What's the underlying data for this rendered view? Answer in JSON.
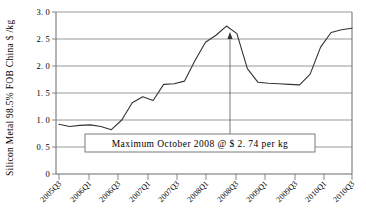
{
  "chart_data": {
    "type": "line",
    "title": "",
    "xlabel": "",
    "ylabel": "Silicon Metal 98.5% FOB China  $ /kg",
    "ylim": [
      0,
      3.0
    ],
    "yticks": [
      "0",
      "0. 5",
      "1. 0",
      "1. 5",
      "2. 0",
      "2. 5",
      "3. 0"
    ],
    "ytick_values": [
      0,
      0.5,
      1.0,
      1.5,
      2.0,
      2.5,
      3.0
    ],
    "grid": true,
    "legend": "none",
    "categories": [
      "2005Q3",
      "2005Q4",
      "2006Q1",
      "2006Q2",
      "2006Q3",
      "2006Q4",
      "2007Q1",
      "2007Q2",
      "2007Q3",
      "2007Q4",
      "2008Q1",
      "2008Q2",
      "2008Q3",
      "2008Q4",
      "2009Q1",
      "2009Q2",
      "2009Q3",
      "2009Q4",
      "2010Q1",
      "2010Q2",
      "2010Q3"
    ],
    "xticks": [
      "2005Q3",
      "2006Q1",
      "2006Q3",
      "2007Q1",
      "2007Q3",
      "2008Q1",
      "2008Q3",
      "2009Q1",
      "2009Q3",
      "2010Q1",
      "2010Q3"
    ],
    "series": [
      {
        "name": "Silicon Metal 98.5% FOB China",
        "values": [
          0.92,
          0.88,
          0.9,
          0.91,
          0.88,
          0.82,
          1.0,
          1.32,
          1.43,
          1.36,
          1.66,
          1.67,
          1.72,
          2.1,
          2.44,
          2.57,
          2.74,
          2.6,
          1.95,
          1.7,
          1.68
        ]
      }
    ],
    "annotation": {
      "label": "Maximum  October  2008  @   $ 2. 74  per  kg",
      "marker_x": "2008Q3",
      "marker_value": 2.74
    },
    "extended_values": [
      0.92,
      0.88,
      0.9,
      0.91,
      0.88,
      0.82,
      1.0,
      1.32,
      1.43,
      1.36,
      1.66,
      1.67,
      1.72,
      2.1,
      2.44,
      2.57,
      2.74,
      2.6,
      1.95,
      1.7,
      1.68,
      1.67,
      1.66,
      1.65,
      1.85,
      2.35,
      2.62,
      2.67,
      2.7
    ]
  }
}
